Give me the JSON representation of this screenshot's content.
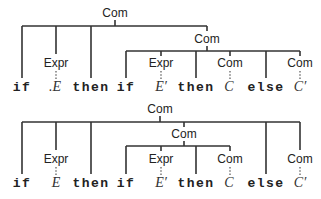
{
  "diagram": {
    "type": "parse-trees",
    "sentence_tokens": [
      "if",
      "E",
      "then",
      "if",
      "E′",
      "then",
      "C",
      "else",
      "C′"
    ],
    "top_tree": {
      "root": "Com",
      "subtree": "Com",
      "nodes": {
        "root_label": "Com",
        "expr1_label": "Expr",
        "sub_com_label": "Com",
        "expr2_label": "Expr",
        "com_c_label": "Com",
        "com_c2_label": "Com"
      },
      "tokens": {
        "if1": "if",
        "e1": ".E",
        "then1": "then",
        "if2": "if",
        "e2": "E′",
        "then2": "then",
        "c": "C",
        "else": "else",
        "c2": "C′"
      }
    },
    "bottom_tree": {
      "root": "Com",
      "subtree": "Com",
      "nodes": {
        "root_label": "Com",
        "expr1_label": "Expr",
        "sub_com_label": "Com",
        "expr2_label": "Expr",
        "com_c_label": "Com",
        "com_c2_label": "Com"
      },
      "tokens": {
        "if1": "if",
        "e1": "E",
        "then1": "then",
        "if2": "if",
        "e2": "E′",
        "then2": "then",
        "c": "C",
        "else": "else",
        "c2": "C′"
      }
    },
    "colors": {
      "line": "#333333",
      "text": "#222222",
      "background": "#ffffff"
    }
  }
}
